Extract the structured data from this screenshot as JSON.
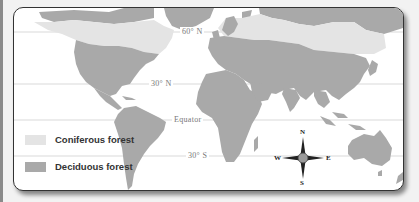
{
  "map": {
    "title": "",
    "type": "world forest distribution map",
    "colors": {
      "background": "#ffffff",
      "coniferous": "#e4e4e4",
      "deciduous": "#a9a9a9",
      "other_land": "#a9a9a9",
      "gridline": "#c8c8c8",
      "frame": "#333333"
    },
    "latitude_lines": [
      {
        "label": "60° N",
        "id": "lat-60n"
      },
      {
        "label": "30° N",
        "id": "lat-30n"
      },
      {
        "label": "Equator",
        "id": "equator"
      },
      {
        "label": "30° S",
        "id": "lat-30s"
      }
    ],
    "legend": [
      {
        "label": "Coniferous forest",
        "color": "#e4e4e4"
      },
      {
        "label": "Deciduous forest",
        "color": "#a9a9a9"
      }
    ],
    "compass": {
      "icon": "compass-rose-icon",
      "north": "N",
      "south": "S",
      "east": "E",
      "west": "W"
    }
  }
}
